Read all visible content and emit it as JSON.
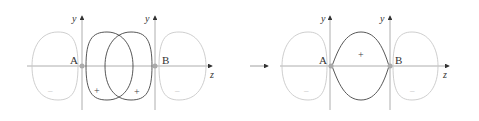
{
  "colors": {
    "bonding_lobe": "#444444",
    "antibonding_lobe": "#c8c8c8",
    "axis": "#999999",
    "nucleus": "#aaaaaa",
    "arrow": "#333333"
  },
  "left_diagram": {
    "nucleus_a_label": "A",
    "nucleus_b_label": "B",
    "y_axis_a_label": "y",
    "y_axis_b_label": "y",
    "z_axis_label": "z",
    "lobe_signs": {
      "outer_left": "–",
      "overlap_left": "+",
      "overlap_right": "+",
      "outer_right": "–"
    }
  },
  "arrow": {
    "direction": "right"
  },
  "right_diagram": {
    "nucleus_a_label": "A",
    "nucleus_b_label": "B",
    "y_axis_a_label": "y",
    "y_axis_b_label": "y",
    "z_axis_label": "z",
    "lobe_signs": {
      "outer_left": "–",
      "bonding": "+",
      "outer_right": "–"
    }
  }
}
